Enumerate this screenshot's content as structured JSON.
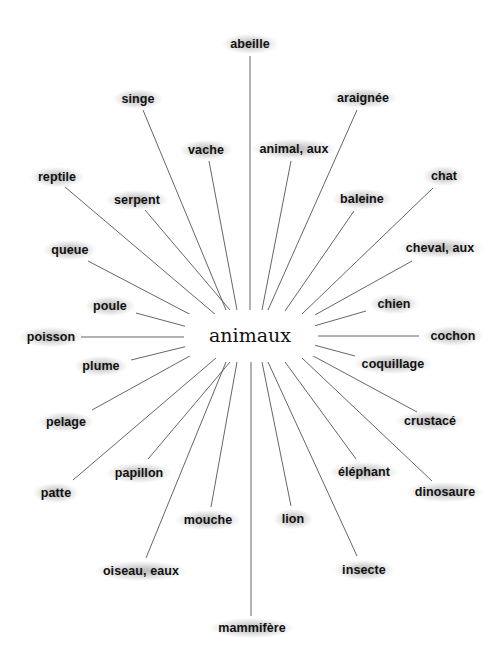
{
  "diagram": {
    "type": "word-map",
    "center": {
      "label": "animaux",
      "x": 250,
      "y": 335
    },
    "line_color": "#555555",
    "text_color": "#111111",
    "nodes": [
      {
        "label": "abeille",
        "x": 250,
        "y": 44,
        "line": [
          250,
          56,
          250,
          310
        ]
      },
      {
        "label": "singe",
        "x": 138,
        "y": 99,
        "line": [
          143,
          110,
          226,
          310
        ]
      },
      {
        "label": "araignée",
        "x": 363,
        "y": 98,
        "line": [
          357,
          110,
          268,
          310
        ]
      },
      {
        "label": "vache",
        "x": 206,
        "y": 150,
        "line": [
          209,
          161,
          237,
          310
        ]
      },
      {
        "label": "animal, aux",
        "x": 294,
        "y": 149,
        "line": [
          291,
          161,
          262,
          310
        ]
      },
      {
        "label": "reptile",
        "x": 57,
        "y": 177,
        "line": [
          65,
          187,
          216,
          315
        ]
      },
      {
        "label": "chat",
        "x": 444,
        "y": 176,
        "line": [
          433,
          188,
          302,
          314
        ]
      },
      {
        "label": "serpent",
        "x": 137,
        "y": 200,
        "line": [
          145,
          210,
          230,
          310
        ]
      },
      {
        "label": "baleine",
        "x": 362,
        "y": 199,
        "line": [
          354,
          211,
          285,
          311
        ]
      },
      {
        "label": "queue",
        "x": 70,
        "y": 250,
        "line": [
          88,
          261,
          197,
          318
        ]
      },
      {
        "label": "cheval, aux",
        "x": 440,
        "y": 248,
        "line": [
          412,
          261,
          304,
          321
        ]
      },
      {
        "label": "poule",
        "x": 110,
        "y": 306,
        "line": [
          136,
          313,
          188,
          327
        ]
      },
      {
        "label": "chien",
        "x": 394,
        "y": 304,
        "line": [
          366,
          311,
          314,
          326
        ]
      },
      {
        "label": "poisson",
        "x": 51,
        "y": 337,
        "line": [
          81,
          337,
          184,
          337
        ]
      },
      {
        "label": "cochon",
        "x": 453,
        "y": 336,
        "line": [
          419,
          336,
          318,
          336
        ]
      },
      {
        "label": "plume",
        "x": 101,
        "y": 366,
        "line": [
          131,
          360,
          188,
          346
        ]
      },
      {
        "label": "coquillage",
        "x": 393,
        "y": 364,
        "line": [
          355,
          356,
          314,
          345
        ]
      },
      {
        "label": "pelage",
        "x": 66,
        "y": 422,
        "line": [
          92,
          410,
          197,
          352
        ]
      },
      {
        "label": "crustacé",
        "x": 430,
        "y": 421,
        "line": [
          417,
          412,
          304,
          351
        ]
      },
      {
        "label": "papillon",
        "x": 139,
        "y": 473,
        "line": [
          148,
          459,
          230,
          362
        ]
      },
      {
        "label": "éléphant",
        "x": 364,
        "y": 472,
        "line": [
          356,
          459,
          285,
          362
        ]
      },
      {
        "label": "patte",
        "x": 56,
        "y": 493,
        "line": [
          73,
          480,
          216,
          358
        ]
      },
      {
        "label": "dinosaure",
        "x": 445,
        "y": 492,
        "line": [
          432,
          481,
          302,
          358
        ]
      },
      {
        "label": "mouche",
        "x": 208,
        "y": 520,
        "line": [
          211,
          507,
          237,
          362
        ]
      },
      {
        "label": "lion",
        "x": 293,
        "y": 519,
        "line": [
          291,
          506,
          262,
          362
        ]
      },
      {
        "label": "oiseau, eaux",
        "x": 141,
        "y": 571,
        "line": [
          146,
          558,
          226,
          362
        ]
      },
      {
        "label": "insecte",
        "x": 364,
        "y": 570,
        "line": [
          357,
          556,
          268,
          362
        ]
      },
      {
        "label": "mammifère",
        "x": 252,
        "y": 628,
        "line": [
          251,
          616,
          251,
          362
        ]
      }
    ]
  }
}
